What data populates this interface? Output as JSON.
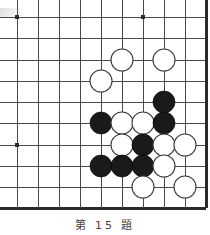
{
  "board": {
    "game": "go",
    "title": "go-problem-diagram",
    "grid": {
      "cols": 10,
      "rows": 10,
      "x_coords": [
        17,
        38,
        59,
        80,
        101,
        122,
        143,
        164,
        185,
        206
      ],
      "y_coords": [
        17,
        38,
        60,
        81,
        102,
        123,
        145,
        166,
        187,
        208
      ],
      "spacing": 21,
      "line_color": "#4a4a4a",
      "edge_color": "#2a2a2a",
      "line_width": 1,
      "edge_width": 3,
      "background": "#ffffff",
      "edges": {
        "right": true,
        "bottom": true,
        "top": false,
        "left": false
      }
    },
    "star_points": [
      {
        "col": 0,
        "row": 0
      },
      {
        "col": 6,
        "row": 0
      },
      {
        "col": 0,
        "row": 6
      }
    ],
    "star_point_size": 4,
    "stone_radius": 11,
    "colors": {
      "black_stone": "#1a1a1a",
      "white_stone": "#ffffff",
      "white_stone_border": "#3a3a3a",
      "black_stone_border": "#000000"
    },
    "stones": [
      {
        "color": "white",
        "col": 5,
        "row": 2
      },
      {
        "color": "white",
        "col": 7,
        "row": 2
      },
      {
        "color": "white",
        "col": 4,
        "row": 3
      },
      {
        "color": "black",
        "col": 7,
        "row": 4
      },
      {
        "color": "black",
        "col": 4,
        "row": 5
      },
      {
        "color": "white",
        "col": 5,
        "row": 5
      },
      {
        "color": "white",
        "col": 6,
        "row": 5
      },
      {
        "color": "black",
        "col": 7,
        "row": 5
      },
      {
        "color": "white",
        "col": 5,
        "row": 6
      },
      {
        "color": "black",
        "col": 6,
        "row": 6
      },
      {
        "color": "white",
        "col": 7,
        "row": 6
      },
      {
        "color": "white",
        "col": 8,
        "row": 6
      },
      {
        "color": "black",
        "col": 4,
        "row": 7
      },
      {
        "color": "black",
        "col": 5,
        "row": 7
      },
      {
        "color": "black",
        "col": 6,
        "row": 7
      },
      {
        "color": "white",
        "col": 7,
        "row": 7
      },
      {
        "color": "white",
        "col": 6,
        "row": 8
      },
      {
        "color": "white",
        "col": 8,
        "row": 8
      }
    ],
    "stone_counts": {
      "black": 7,
      "white": 11
    }
  },
  "caption": {
    "text": "第 15 題"
  }
}
